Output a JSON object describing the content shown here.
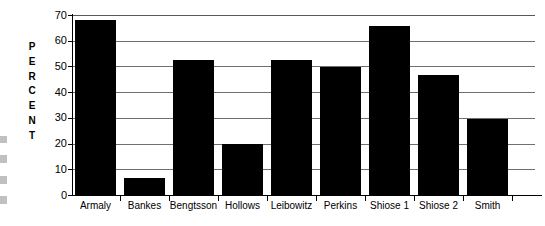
{
  "chart_data": {
    "type": "bar",
    "title": "",
    "subtitle": "",
    "xlabel": "",
    "ylabel": "PERCENT",
    "ylabel_letters": [
      "P",
      "E",
      "R",
      "C",
      "E",
      "N",
      "T"
    ],
    "categories": [
      "Armaly",
      "Bankes",
      "Bengtsson",
      "Hollows",
      "Leibowitz",
      "Perkins",
      "Shiose 1",
      "Shiose 2",
      "Smith"
    ],
    "values": [
      68,
      6.7,
      52.5,
      19.8,
      52.5,
      49.7,
      65.7,
      46.7,
      29.7
    ],
    "ylim": [
      0,
      70
    ],
    "ytick_labels": [
      "0",
      "10",
      "20",
      "30",
      "40",
      "50",
      "60",
      "70"
    ],
    "ytick_values": [
      0,
      10,
      20,
      30,
      40,
      50,
      60,
      70
    ],
    "grid": true,
    "legend": false,
    "legend_position": "none",
    "bar_color": "#000000",
    "grid_color": "#6f6f6f",
    "axis_color": "#000000",
    "background_color": "#ffffff"
  }
}
